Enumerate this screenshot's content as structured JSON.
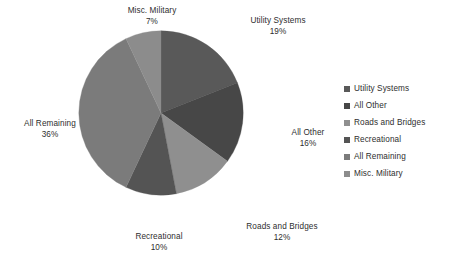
{
  "chart_data": {
    "type": "pie",
    "title": "",
    "subtitle": "",
    "xlabel": "",
    "ylabel": "",
    "grid": false,
    "legend_position": "right",
    "units": "percent",
    "categories": [
      "Utility Systems",
      "All Other",
      "Roads and Bridges",
      "Recreational",
      "All Remaining",
      "Misc. Military"
    ],
    "values": [
      19,
      16,
      12,
      10,
      36,
      7
    ],
    "colors": [
      "#595959",
      "#474747",
      "#8f8f8f",
      "#545454",
      "#7b7b7b",
      "#8c8c8c"
    ],
    "start_angle_deg": 0,
    "direction": "clockwise",
    "slices": [
      {
        "label": "Utility Systems",
        "value": 19,
        "display_value": "19%",
        "color": "#595959"
      },
      {
        "label": "All Other",
        "value": 16,
        "display_value": "16%",
        "color": "#474747"
      },
      {
        "label": "Roads and Bridges",
        "value": 12,
        "display_value": "12%",
        "color": "#8f8f8f"
      },
      {
        "label": "Recreational",
        "value": 10,
        "display_value": "10%",
        "color": "#545454"
      },
      {
        "label": "All Remaining",
        "value": 36,
        "display_value": "36%",
        "color": "#7b7b7b"
      },
      {
        "label": "Misc. Military",
        "value": 7,
        "display_value": "7%",
        "color": "#8c8c8c"
      }
    ]
  },
  "labels": {
    "misc_military": {
      "name": "Misc. Military",
      "pct": "7%"
    },
    "utility_systems": {
      "name": "Utility Systems",
      "pct": "19%"
    },
    "all_other": {
      "name": "All Other",
      "pct": "16%"
    },
    "roads_bridges": {
      "name": "Roads and Bridges",
      "pct": "12%"
    },
    "recreational": {
      "name": "Recreational",
      "pct": "10%"
    },
    "all_remaining": {
      "name": "All Remaining",
      "pct": "36%"
    }
  },
  "legend": {
    "items": [
      {
        "label": "Utility Systems",
        "color": "#595959"
      },
      {
        "label": "All Other",
        "color": "#474747"
      },
      {
        "label": "Roads and Bridges",
        "color": "#8f8f8f"
      },
      {
        "label": "Recreational",
        "color": "#545454"
      },
      {
        "label": "All Remaining",
        "color": "#7b7b7b"
      },
      {
        "label": "Misc. Military",
        "color": "#8c8c8c"
      }
    ]
  }
}
